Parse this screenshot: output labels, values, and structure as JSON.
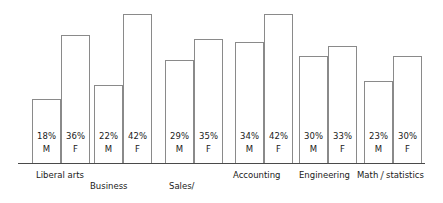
{
  "chart_data": {
    "type": "bar",
    "title": "",
    "subtitle": "",
    "xlabel": "",
    "ylabel": "",
    "ylim": [
      0,
      45
    ],
    "grid": false,
    "legend": "none",
    "axis": {
      "baseline_visible": true,
      "y_axis_visible": false
    },
    "categories": [
      "Liberal arts",
      "Business administration",
      "Sales/ marketing",
      "Accounting",
      "Engineering",
      "Math / statistics"
    ],
    "series": [
      {
        "name": "M",
        "values": [
          18,
          22,
          29,
          34,
          30,
          23
        ]
      },
      {
        "name": "F",
        "values": [
          36,
          42,
          35,
          42,
          33,
          30
        ]
      }
    ],
    "bars": [
      {
        "group": "Liberal arts",
        "gender": "M",
        "value": 18,
        "value_label": "18%"
      },
      {
        "group": "Liberal arts",
        "gender": "F",
        "value": 36,
        "value_label": "36%"
      },
      {
        "group": "Business administration",
        "gender": "M",
        "value": 22,
        "value_label": "22%"
      },
      {
        "group": "Business administration",
        "gender": "F",
        "value": 42,
        "value_label": "42%"
      },
      {
        "group": "Sales/ marketing",
        "gender": "M",
        "value": 29,
        "value_label": "29%"
      },
      {
        "group": "Sales/ marketing",
        "gender": "F",
        "value": 35,
        "value_label": "35%"
      },
      {
        "group": "Accounting",
        "gender": "M",
        "value": 34,
        "value_label": "34%"
      },
      {
        "group": "Accounting",
        "gender": "F",
        "value": 42,
        "value_label": "42%"
      },
      {
        "group": "Engineering",
        "gender": "M",
        "value": 30,
        "value_label": "30%"
      },
      {
        "group": "Engineering",
        "gender": "F",
        "value": 33,
        "value_label": "33%"
      },
      {
        "group": "Math / statistics",
        "gender": "M",
        "value": 23,
        "value_label": "23%"
      },
      {
        "group": "Math / statistics",
        "gender": "F",
        "value": 30,
        "value_label": "30%"
      }
    ],
    "colors": {
      "bar_fill": "#ffffff",
      "bar_stroke": "#8a8a8a",
      "axis": "#4a4a4a",
      "text": "#1a1a1a",
      "background": "#ffffff"
    }
  },
  "labels": {
    "group_1": "Liberal arts",
    "group_2_line1": "Business",
    "group_2_line2": "administration",
    "group_3_line1": "Sales/",
    "group_3_line2": "marketing",
    "group_4": "Accounting",
    "group_5": "Engineering",
    "group_6_part1": "Math",
    "group_6_sep": "/",
    "group_6_part2": "statistics",
    "values": {
      "v1": "18%",
      "v2": "36%",
      "v3": "22%",
      "v4": "42%",
      "v5": "29%",
      "v6": "35%",
      "v7": "34%",
      "v8": "42%",
      "v9": "30%",
      "v10": "33%",
      "v11": "23%",
      "v12": "30%"
    },
    "genders": {
      "g1": "M",
      "g2": "F",
      "g3": "M",
      "g4": "F",
      "g5": "M",
      "g6": "F",
      "g7": "M",
      "g8": "F",
      "g9": "M",
      "g10": "F",
      "g11": "M",
      "g12": "F"
    }
  }
}
